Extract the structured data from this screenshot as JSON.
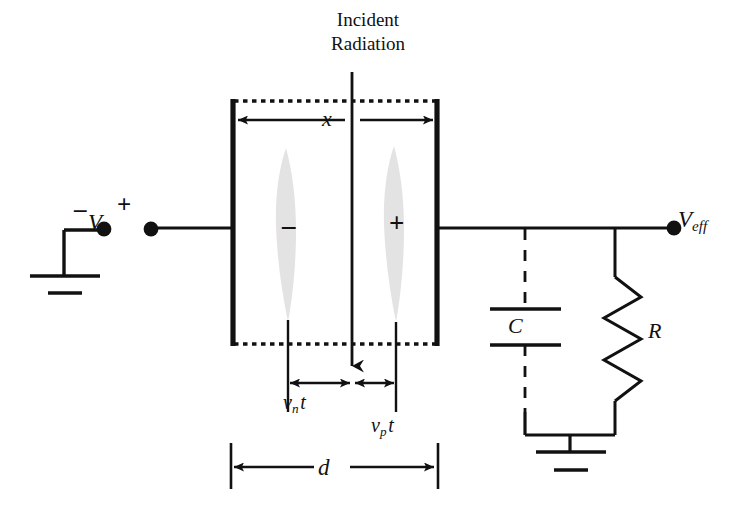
{
  "figure": {
    "type": "semiconductor-detector-circuit-schematic",
    "background_color": "#ffffff",
    "ink_color": "#111111",
    "charge_cloud_color": "#e3e3e3"
  },
  "labels": {
    "incident_radiation_line1": "Incident",
    "incident_radiation_line2": "Radiation",
    "bias_voltage": "V",
    "bias_voltage_sub": "0",
    "bias_minus_terminal": "–",
    "bias_plus_terminal": "+",
    "output_voltage": "V",
    "output_voltage_sub": "eff",
    "depth_x": "x",
    "thickness_d": "d",
    "electron_drift": "v",
    "electron_drift_sub": "n",
    "electron_drift_time": "t",
    "hole_drift": "v",
    "hole_drift_sub": "p",
    "hole_drift_time": "t",
    "capacitor": "C",
    "resistor": "R",
    "electron_cloud_sign": "–",
    "hole_cloud_sign": "+"
  },
  "geometry": {
    "detector_left_electrode_x": 232,
    "detector_right_electrode_x": 437,
    "detector_top_y": 100,
    "detector_bottom_y": 344,
    "radiation_line_x": 352,
    "wire_y": 225,
    "capacitor_x": 525,
    "resistor_x": 615,
    "ground_y": 435
  }
}
